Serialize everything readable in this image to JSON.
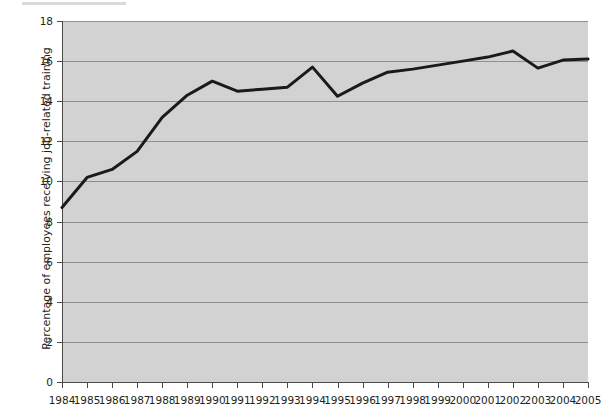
{
  "figure": {
    "kind": "line-chart",
    "background_color": "#ffffff",
    "plot_background_color": "#d2d2d2",
    "gridline_color": "#8f8f8f",
    "axis_color": "#4a4a4a",
    "series_color": "#1a1a1a"
  },
  "chart_data": {
    "type": "line",
    "title": "",
    "subtitle": "",
    "xlabel": "",
    "ylabel": "Percentage of employees receiving job-related training",
    "categories": [
      "1984",
      "1985",
      "1986",
      "1987",
      "1988",
      "1989",
      "1990",
      "1991",
      "1992",
      "1993",
      "1994",
      "1995",
      "1996",
      "1997",
      "1998",
      "1999",
      "2000",
      "2001",
      "2002",
      "2003",
      "2004",
      "2005"
    ],
    "values": [
      8.7,
      10.2,
      10.6,
      11.5,
      13.2,
      14.3,
      15.0,
      14.5,
      14.6,
      14.7,
      15.7,
      14.25,
      14.9,
      15.45,
      15.6,
      15.8,
      16.0,
      16.2,
      16.5,
      15.65,
      16.05,
      16.1
    ],
    "series": [
      {
        "name": "Percentage of employees receiving job-related training",
        "color": "#1a1a1a",
        "values": [
          8.7,
          10.2,
          10.6,
          11.5,
          13.2,
          14.3,
          15.0,
          14.5,
          14.6,
          14.7,
          15.7,
          14.25,
          14.9,
          15.45,
          15.6,
          15.8,
          16.0,
          16.2,
          16.5,
          15.65,
          16.05,
          16.1
        ]
      }
    ],
    "ylim": [
      0,
      18
    ],
    "yticks": [
      0,
      2,
      4,
      6,
      8,
      10,
      12,
      14,
      16,
      18
    ],
    "ytick_labels": [
      "0",
      "2",
      "4",
      "6",
      "8",
      "10",
      "12",
      "14",
      "16",
      "18"
    ],
    "xtick_labels": [
      "1984",
      "1985",
      "1986",
      "1987",
      "1988",
      "1989",
      "1990",
      "1991",
      "1992",
      "1993",
      "1994",
      "1995",
      "1996",
      "1997",
      "1998",
      "1999",
      "2000",
      "2001",
      "2002",
      "2003",
      "2004",
      "2005"
    ],
    "grid": true,
    "grid_axis": "y",
    "legend": false,
    "legend_position": "none",
    "markers": false,
    "line_width": 3,
    "annotations": []
  }
}
